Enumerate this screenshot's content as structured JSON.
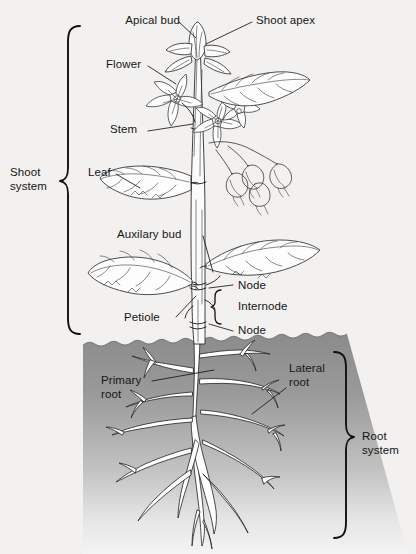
{
  "figure": {
    "background_color": "#f2f1ef",
    "ink_color": "#161616",
    "soil_top_color": "#8d8d8d",
    "soil_bottom_color": "#f4f4f4",
    "root_fill_color": "#ffffff"
  },
  "systems": [
    {
      "id": "shoot-system",
      "label": "Shoot\nsystem",
      "brace_side": "left"
    },
    {
      "id": "root-system",
      "label": "Root\nsystem",
      "brace_side": "right"
    }
  ],
  "labels": [
    {
      "id": "apical-bud",
      "text": "Apical bud",
      "align": "right"
    },
    {
      "id": "shoot-apex",
      "text": "Shoot apex",
      "align": "left"
    },
    {
      "id": "flower",
      "text": "Flower",
      "align": "left"
    },
    {
      "id": "stem",
      "text": "Stem",
      "align": "left"
    },
    {
      "id": "leaf",
      "text": "Leaf",
      "align": "left"
    },
    {
      "id": "auxilary-bud",
      "text": "Auxilary bud",
      "align": "left"
    },
    {
      "id": "petiole",
      "text": "Petiole",
      "align": "left"
    },
    {
      "id": "node-upper",
      "text": "Node",
      "align": "left"
    },
    {
      "id": "internode",
      "text": "Internode",
      "align": "left"
    },
    {
      "id": "node-lower",
      "text": "Node",
      "align": "left"
    },
    {
      "id": "primary-root",
      "text": "Primary\nroot",
      "align": "left"
    },
    {
      "id": "lateral-root",
      "text": "Lateral\nroot",
      "align": "left"
    }
  ],
  "label_text": {
    "apical_bud": "Apical bud",
    "shoot_apex": "Shoot apex",
    "flower": "Flower",
    "stem": "Stem",
    "leaf": "Leaf",
    "auxilary_bud": "Auxilary bud",
    "petiole": "Petiole",
    "node_upper": "Node",
    "internode": "Internode",
    "node_lower": "Node",
    "primary_root_l1": "Primary",
    "primary_root_l2": "root",
    "lateral_root_l1": "Lateral",
    "lateral_root_l2": "root",
    "shoot_system_l1": "Shoot",
    "shoot_system_l2": "system",
    "root_system_l1": "Root",
    "root_system_l2": "system"
  }
}
